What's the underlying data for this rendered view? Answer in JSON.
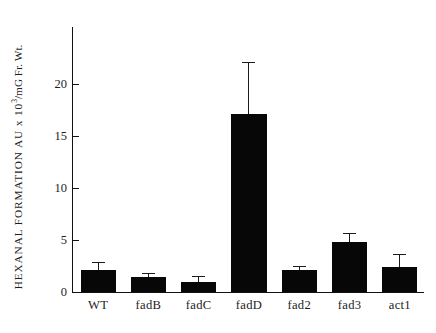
{
  "chart_data": {
    "type": "bar",
    "title": "",
    "xlabel": "",
    "ylabel": "HEXANAL FORMATION AU x 10³/mG Fr. Wt.",
    "ylabel_parts": {
      "pre": "HEXANAL FORMATION AU x 10",
      "exponent": "3",
      "post": "/mG Fr. Wt."
    },
    "categories": [
      "WT",
      "fadB",
      "fadC",
      "fadD",
      "fad2",
      "fad3",
      "act1"
    ],
    "values": [
      2.1,
      1.4,
      0.95,
      17.1,
      2.1,
      4.8,
      2.4
    ],
    "errors_upper": [
      2.8,
      1.7,
      1.4,
      22.0,
      2.4,
      5.6,
      3.6
    ],
    "error_magnitudes": [
      0.7,
      0.3,
      0.45,
      4.9,
      0.3,
      0.8,
      1.2
    ],
    "ylim": [
      0,
      25.5
    ],
    "yticks": [
      0,
      5,
      10,
      15,
      20
    ],
    "yticklabels": [
      "0",
      "5",
      "10",
      "15",
      "20"
    ],
    "grid": false,
    "legend": false,
    "bar_color": "#070707",
    "axis_color": "#121212",
    "background": "#ffffff"
  }
}
